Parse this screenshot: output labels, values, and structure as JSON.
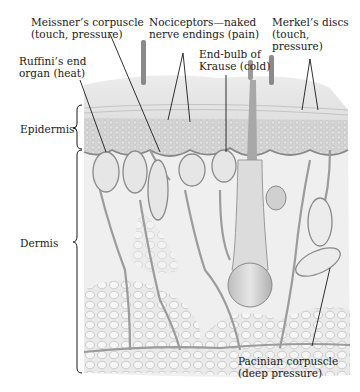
{
  "diagram": {
    "labels": {
      "meissner": {
        "line1": "Meissner’s corpuscle",
        "line2": "(touch, pressure)"
      },
      "nociceptors": {
        "line1": "Nociceptors—naked",
        "line2": "nerve endings (pain)"
      },
      "merkel": {
        "line1": "Merkel’s discs",
        "line2": "(touch,",
        "line3": "pressure)"
      },
      "ruffini": {
        "line1": "Ruffini’s end",
        "line2": "organ (heat)"
      },
      "krause": {
        "line1": "End-bulb of",
        "line2": "Krause (cold)"
      },
      "epidermis": "Epidermis",
      "dermis": "Dermis",
      "pacinian": {
        "line1": "Pacinian corpuscle",
        "line2": "(deep pressure)"
      }
    },
    "colors": {
      "skin_surface": "#e6e6e6",
      "epidermis": "#d2d2d2",
      "dermis": "#eeeeee",
      "fat": "#e2e2e2",
      "nerve": "#9a9a9a",
      "leader_line": "#1a1a1a"
    }
  }
}
